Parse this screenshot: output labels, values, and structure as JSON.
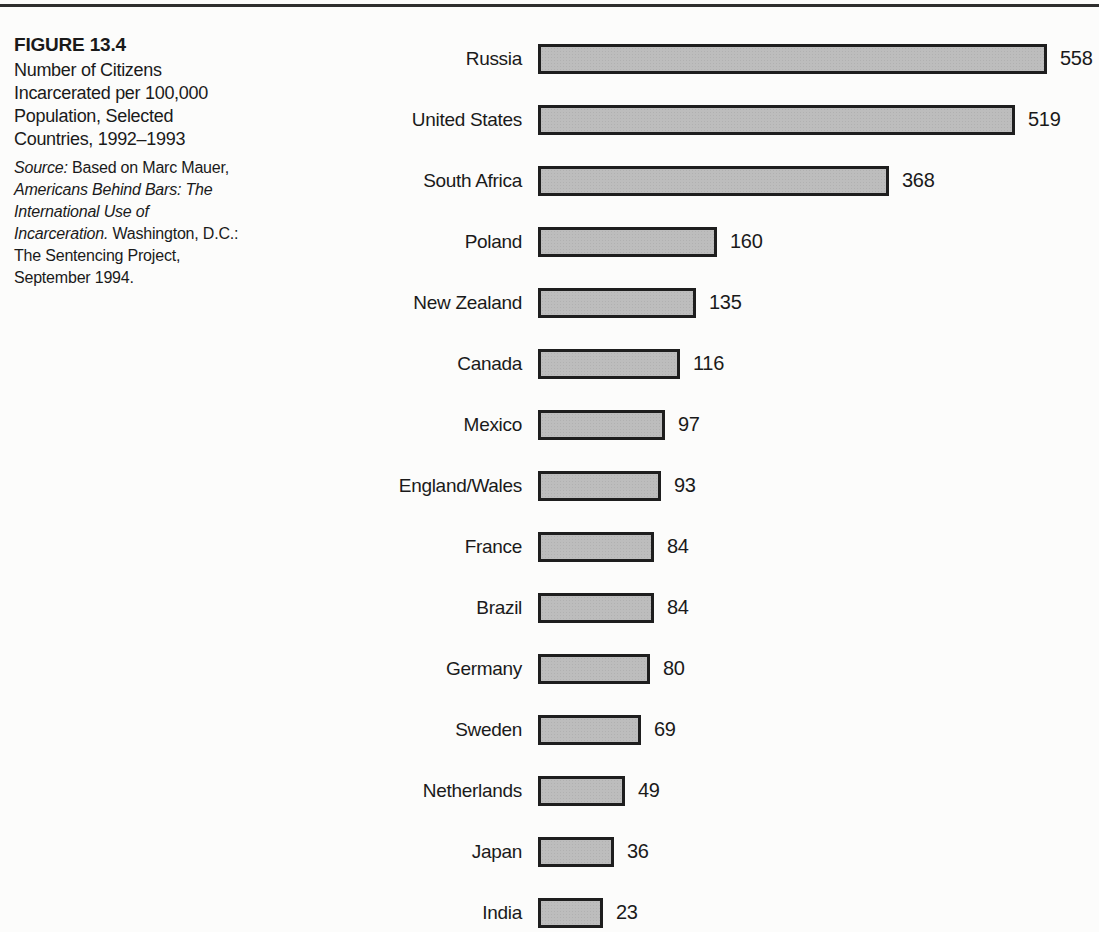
{
  "page": {
    "background": "#fcfcfb",
    "top_rule_color": "#2e2e2e"
  },
  "caption": {
    "figure_label": "FIGURE 13.4",
    "title_lines": [
      "Number of Citizens",
      "Incarcerated per 100,000",
      "Population, Selected",
      "Countries, 1992–1993"
    ],
    "source_lines": [
      [
        {
          "t": "Source:",
          "i": true
        },
        {
          "t": " Based on Marc Mauer,",
          "i": false
        }
      ],
      [
        {
          "t": "Americans Behind Bars: The",
          "i": true
        }
      ],
      [
        {
          "t": "International Use of",
          "i": true
        }
      ],
      [
        {
          "t": "Incarceration.",
          "i": true
        },
        {
          "t": " Washington, D.C.:",
          "i": false
        }
      ],
      [
        {
          "t": "The Sentencing Project,",
          "i": false
        }
      ],
      [
        {
          "t": "September 1994.",
          "i": false
        }
      ]
    ]
  },
  "chart_data": {
    "type": "bar",
    "orientation": "horizontal",
    "xlabel": "",
    "ylabel": "",
    "categories": [
      "Russia",
      "United States",
      "South Africa",
      "Poland",
      "New Zealand",
      "Canada",
      "Mexico",
      "England/Wales",
      "France",
      "Brazil",
      "Germany",
      "Sweden",
      "Netherlands",
      "Japan",
      "India"
    ],
    "values": [
      558,
      519,
      368,
      160,
      135,
      116,
      97,
      93,
      84,
      84,
      80,
      69,
      49,
      36,
      23
    ],
    "xlim": [
      0,
      600
    ],
    "grid": false,
    "legend_position": "none",
    "value_labels_shown": true,
    "bar_fill": "#bdbdbd",
    "bar_border": "#1e1e1e"
  }
}
